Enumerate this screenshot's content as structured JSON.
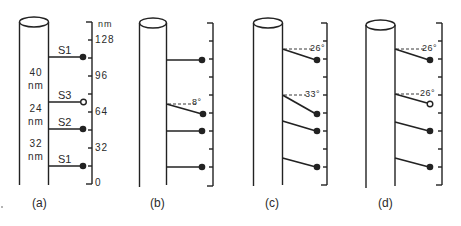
{
  "figure": {
    "panels": [
      {
        "caption": "(a)",
        "scale_unit": "nm",
        "scale_ticks": [
          "128",
          "96",
          "64",
          "32",
          "0"
        ],
        "branches": [
          {
            "label": "S1",
            "marker": "filled",
            "angle": null
          },
          {
            "label": "S3",
            "marker": "open",
            "angle": null
          },
          {
            "label": "S2",
            "marker": "filled",
            "angle": null
          },
          {
            "label": "S1",
            "marker": "filled",
            "angle": null
          }
        ],
        "spacings": [
          {
            "value": "40",
            "unit": "nm"
          },
          {
            "value": "24",
            "unit": "nm"
          },
          {
            "value": "32",
            "unit": "nm"
          }
        ]
      },
      {
        "caption": "(b)",
        "branches": [
          {
            "marker": "filled",
            "angle": null
          },
          {
            "marker": "filled",
            "angle": "8°"
          },
          {
            "marker": "filled",
            "angle": null
          },
          {
            "marker": "filled",
            "angle": null
          }
        ]
      },
      {
        "caption": "(c)",
        "branches": [
          {
            "marker": "filled",
            "angle": "26°"
          },
          {
            "marker": "filled",
            "angle": "33°"
          },
          {
            "marker": "filled",
            "angle": null
          },
          {
            "marker": "filled",
            "angle": null
          }
        ]
      },
      {
        "caption": "(d)",
        "branches": [
          {
            "marker": "filled",
            "angle": "26°"
          },
          {
            "marker": "open",
            "angle": "26°"
          },
          {
            "marker": "filled",
            "angle": null
          },
          {
            "marker": "filled",
            "angle": null
          }
        ]
      }
    ]
  }
}
